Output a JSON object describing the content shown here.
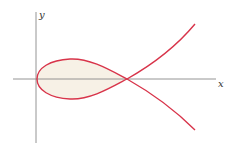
{
  "diagram": {
    "type": "curve-plot",
    "axes": {
      "x_label": "x",
      "y_label": "y"
    },
    "colors": {
      "curve": "#d8344a",
      "axis": "#888888",
      "fill": "#f7f1e6"
    }
  }
}
